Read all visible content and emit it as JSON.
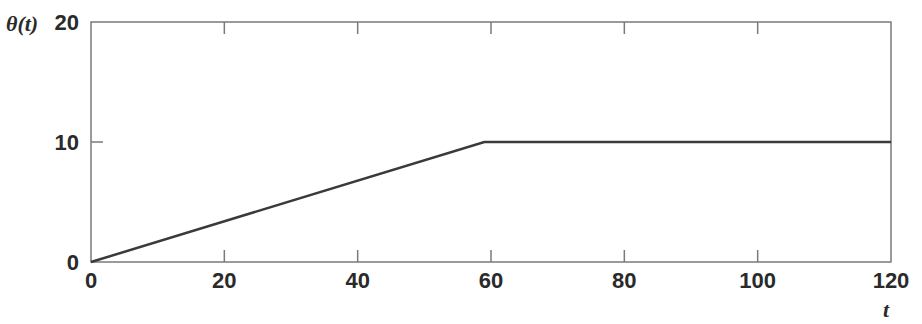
{
  "chart_data": {
    "type": "line",
    "title": "",
    "xlabel": "t",
    "ylabel": "θ(t)",
    "xlim": [
      0,
      120
    ],
    "ylim": [
      0,
      20
    ],
    "grid": false,
    "legend": null,
    "x_ticks": [
      0,
      20,
      40,
      60,
      80,
      100,
      120
    ],
    "y_ticks": [
      0,
      10,
      20
    ],
    "series": [
      {
        "name": "θ(t)",
        "color": "#3a3a3a",
        "x": [
          0,
          59,
          120
        ],
        "y": [
          0,
          10,
          10
        ]
      }
    ]
  },
  "labels": {
    "xlabel": "t",
    "ylabel": "θ(t)",
    "x_ticks": [
      "0",
      "20",
      "40",
      "60",
      "80",
      "100",
      "120"
    ],
    "y_ticks": [
      "0",
      "10",
      "20"
    ]
  },
  "colors": {
    "frame": "#7a7a7a",
    "line": "#3a3a3a",
    "text": "#2a2a2a"
  }
}
